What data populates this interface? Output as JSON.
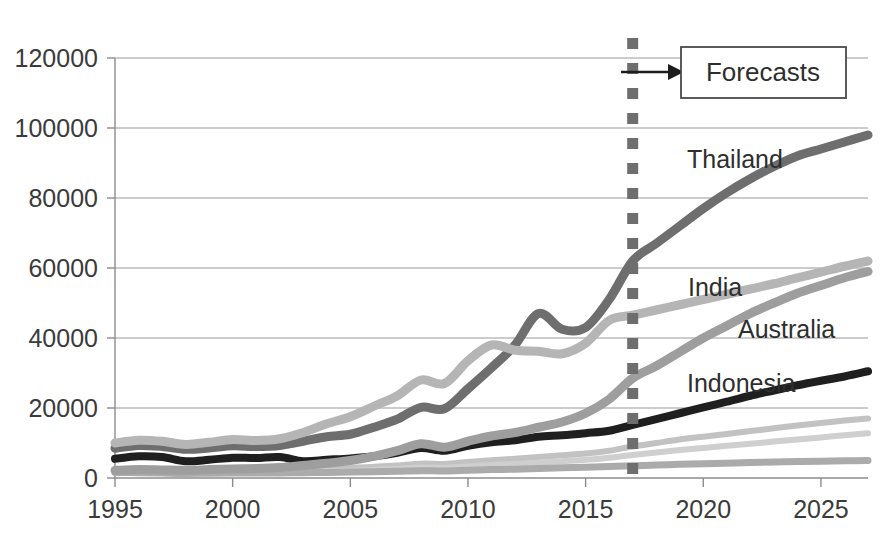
{
  "chart_data": {
    "type": "line",
    "title": "",
    "subtitle": "",
    "xlabel": "",
    "ylabel": "",
    "xlim": [
      1995,
      2027
    ],
    "ylim": [
      0,
      120000
    ],
    "grid": true,
    "legend_position": "inline-labels",
    "x_ticks": [
      "1995",
      "2000",
      "2005",
      "2010",
      "2015",
      "2020",
      "2025"
    ],
    "x_tick_values": [
      1995,
      2000,
      2005,
      2010,
      2015,
      2020,
      2025
    ],
    "y_ticks": [
      "0",
      "20000",
      "40000",
      "60000",
      "80000",
      "100000",
      "120000"
    ],
    "y_tick_values": [
      0,
      20000,
      40000,
      60000,
      80000,
      100000,
      120000
    ],
    "x": [
      1995,
      1996,
      1997,
      1998,
      1999,
      2000,
      2001,
      2002,
      2003,
      2004,
      2005,
      2006,
      2007,
      2008,
      2009,
      2010,
      2011,
      2012,
      2013,
      2014,
      2015,
      2016,
      2017,
      2018,
      2019,
      2020,
      2021,
      2022,
      2023,
      2024,
      2025,
      2026,
      2027
    ],
    "forecast_start_year": 2017,
    "series": [
      {
        "name": "Thailand",
        "color": "#6e6e6e",
        "width": 9,
        "labeled": true,
        "values": [
          8500,
          9300,
          9000,
          8200,
          8600,
          9200,
          9000,
          9300,
          10500,
          11800,
          12500,
          14500,
          16800,
          20200,
          19800,
          25500,
          31500,
          38000,
          47000,
          42500,
          43000,
          51000,
          62000,
          67000,
          72000,
          77000,
          81500,
          85500,
          89000,
          92000,
          94000,
          96000,
          98000
        ]
      },
      {
        "name": "India",
        "color": "#b5b5b5",
        "width": 9,
        "labeled": true,
        "values": [
          10000,
          10800,
          10500,
          9600,
          10200,
          11000,
          10700,
          11200,
          13000,
          15500,
          17500,
          20500,
          23500,
          28000,
          27000,
          33500,
          38000,
          36500,
          36200,
          35500,
          38500,
          45000,
          46500,
          48000,
          49500,
          51000,
          52500,
          54000,
          55500,
          57200,
          58800,
          60500,
          62000
        ]
      },
      {
        "name": "Australia",
        "color": "#9e9e9e",
        "width": 9,
        "labeled": true,
        "values": [
          2200,
          2400,
          2300,
          2200,
          2400,
          2600,
          2700,
          3000,
          3600,
          4200,
          5000,
          6200,
          7800,
          9800,
          8800,
          10500,
          12000,
          13000,
          14500,
          16000,
          18500,
          22500,
          28500,
          32000,
          36000,
          40000,
          43500,
          47000,
          50000,
          52800,
          55000,
          57200,
          59000
        ]
      },
      {
        "name": "Indonesia",
        "color": "#1f1f1f",
        "width": 8,
        "labeled": true,
        "values": [
          5500,
          6200,
          6000,
          4800,
          5200,
          5800,
          5700,
          6000,
          4800,
          5200,
          5600,
          6200,
          7200,
          8600,
          7800,
          9200,
          10200,
          10800,
          11800,
          12200,
          12800,
          13500,
          15200,
          16800,
          18500,
          20200,
          21800,
          23500,
          25000,
          26500,
          27800,
          29000,
          30500
        ]
      },
      {
        "name": "",
        "color": "#c2c2c2",
        "width": 6,
        "labeled": false,
        "values": [
          1900,
          2000,
          2000,
          1900,
          2000,
          2100,
          2100,
          2200,
          2400,
          2600,
          2900,
          3200,
          3600,
          4100,
          4000,
          4600,
          5100,
          5500,
          6000,
          6500,
          7000,
          7800,
          9000,
          10000,
          11000,
          11800,
          12600,
          13400,
          14200,
          15000,
          15700,
          16400,
          17000
        ]
      },
      {
        "name": "",
        "color": "#cfcfcf",
        "width": 6,
        "labeled": false,
        "values": [
          1400,
          1500,
          1500,
          1400,
          1500,
          1600,
          1600,
          1700,
          1800,
          1900,
          2100,
          2300,
          2600,
          3000,
          2900,
          3300,
          3700,
          4000,
          4400,
          4800,
          5200,
          5800,
          6600,
          7300,
          8000,
          8600,
          9200,
          9800,
          10400,
          11000,
          11600,
          12200,
          12800
        ]
      },
      {
        "name": "",
        "color": "#ababab",
        "width": 7,
        "labeled": false,
        "values": [
          1600,
          1500,
          1400,
          1300,
          1350,
          1400,
          1400,
          1450,
          1500,
          1600,
          1700,
          1800,
          1900,
          2100,
          2000,
          2200,
          2400,
          2500,
          2700,
          2900,
          3100,
          3300,
          3500,
          3700,
          3900,
          4100,
          4250,
          4400,
          4550,
          4700,
          4800,
          4900,
          5000
        ]
      }
    ],
    "annotations": [
      {
        "name": "forecast-divider",
        "type": "vertical-dashed-line",
        "at_year": 2017,
        "color": "#6e6e6e"
      },
      {
        "name": "forecast-callout",
        "type": "boxed-label",
        "text": "Forecasts",
        "arrow": true
      }
    ]
  },
  "labels": {
    "thailand": "Thailand",
    "india": "India",
    "australia": "Australia",
    "indonesia": "Indonesia",
    "forecasts": "Forecasts"
  }
}
